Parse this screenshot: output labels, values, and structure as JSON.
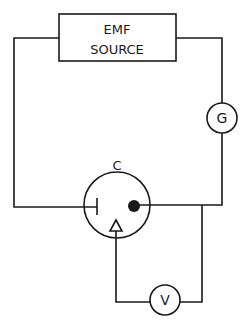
{
  "diagram": {
    "type": "circuit",
    "emf_source": {
      "line1": "EMF",
      "line2": "SOURCE"
    },
    "galvanometer": {
      "label": "G"
    },
    "cell": {
      "label": "C"
    },
    "voltmeter": {
      "label": "V"
    },
    "colors": {
      "ink": "#1a1a1a",
      "background": "#ffffff"
    }
  }
}
